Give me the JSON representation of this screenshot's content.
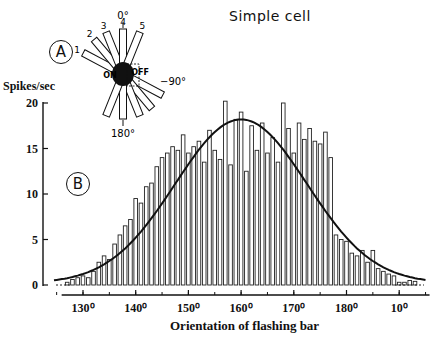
{
  "title": "Simple cell",
  "panel_labels": {
    "a": "A",
    "b": "B"
  },
  "inset": {
    "angle_top": "0°",
    "angle_bottom": "180°",
    "angle_right": "−90°",
    "on_label": "ON",
    "off_label": "OFF",
    "bar_numbers": [
      "1",
      "2",
      "3",
      "4",
      "5"
    ]
  },
  "chart_data": {
    "type": "bar",
    "title": "Simple cell",
    "xlabel": "Orientation of flashing bar",
    "ylabel": "Spikes/sec",
    "ylim": [
      0,
      20
    ],
    "yticks": [
      0,
      5,
      10,
      15,
      20
    ],
    "xtick_labels": [
      "130°",
      "140°",
      "150°",
      "160°",
      "170°",
      "180°",
      "10°"
    ],
    "xtick_degrees": [
      130,
      140,
      150,
      160,
      170,
      180,
      190
    ],
    "xlim_degrees": [
      125,
      195
    ],
    "grid": false,
    "x": [
      127,
      128,
      129,
      130,
      131,
      132,
      133,
      134,
      135,
      136,
      137,
      138,
      139,
      140,
      141,
      142,
      143,
      144,
      145,
      146,
      147,
      148,
      149,
      150,
      151,
      152,
      153,
      154,
      155,
      156,
      157,
      158,
      159,
      160,
      161,
      162,
      163,
      164,
      165,
      166,
      167,
      168,
      169,
      170,
      171,
      172,
      173,
      174,
      175,
      176,
      177,
      178,
      179,
      180,
      181,
      182,
      183,
      184,
      185,
      186,
      187,
      188,
      189,
      190,
      191,
      192,
      193
    ],
    "values": [
      0.3,
      0.6,
      0.8,
      1.0,
      0.8,
      1.5,
      2.5,
      3.2,
      2.8,
      4.5,
      5.5,
      6.5,
      7.2,
      9.5,
      9.0,
      10.8,
      11.2,
      13.0,
      14.0,
      14.5,
      15.2,
      14.8,
      16.5,
      14.5,
      15.2,
      15.8,
      13.5,
      17.0,
      14.8,
      13.8,
      20.2,
      13.2,
      18.2,
      19.0,
      12.5,
      17.5,
      14.8,
      17.8,
      14.5,
      16.2,
      13.5,
      20.0,
      17.2,
      14.5,
      17.8,
      16.0,
      17.2,
      15.8,
      15.5,
      16.8,
      14.0,
      16.2,
      13.2,
      15.8,
      13.0,
      15.8,
      12.5,
      14.0,
      10.5,
      13.5,
      13.0,
      12.2,
      9.5,
      11.2,
      8.5,
      8.0,
      7.8
    ],
    "tail_values": [
      5.5,
      5.0,
      4.8,
      3.5,
      3.2,
      3.8,
      2.5,
      3.8,
      1.8,
      1.5,
      1.2,
      1.0,
      0.3,
      0.3,
      0.5,
      0.4
    ],
    "tail_x": [
      178,
      179,
      180,
      181,
      182,
      183,
      184,
      185,
      186,
      187,
      188,
      189,
      190,
      191,
      192,
      193
    ],
    "series": [
      {
        "name": "Measured response (bars)",
        "style": "open bars"
      },
      {
        "name": "Fitted tuning curve",
        "style": "smooth line",
        "peak_x": 160,
        "peak_y": 18.2,
        "base_y": 0.2
      }
    ]
  }
}
